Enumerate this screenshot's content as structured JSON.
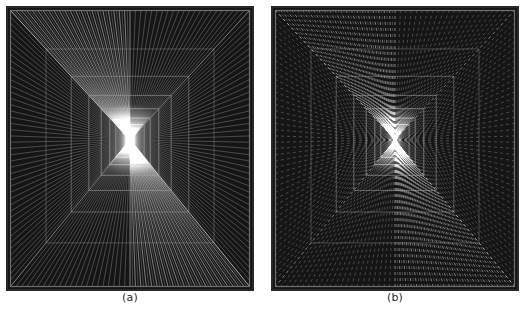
{
  "figure": {
    "title": "",
    "background_color": "#ffffff",
    "width": 527,
    "height": 323,
    "panel_count": 2
  },
  "panels": [
    {
      "id": "panel-a",
      "caption": "(a)",
      "line_style": "solid",
      "background_color": "#151515",
      "frame_color": "#6e6e6e",
      "ray_color": "#9a9a9a",
      "center_glow_color": "#e8e8e8",
      "x": 6,
      "y": 6,
      "width": 248,
      "height": 285,
      "rays": 176,
      "nested_frames": 7,
      "center_x": 0.5,
      "center_y": 0.47
    },
    {
      "id": "panel-b",
      "caption": "(b)",
      "line_style": "dashed",
      "background_color": "#151515",
      "frame_color": "#6e6e6e",
      "ray_color": "#9a9a9a",
      "center_glow_color": "#e8e8e8",
      "x": 271,
      "y": 6,
      "width": 248,
      "height": 285,
      "rays": 176,
      "nested_frames": 7,
      "center_x": 0.5,
      "center_y": 0.47,
      "dash_on": 3,
      "dash_off": 3
    }
  ],
  "captions": {
    "a": "(a)",
    "b": "(b)"
  },
  "colors": {
    "page_background": "#ffffff",
    "panel_background": "#151515",
    "line": "#9a9a9a",
    "frame": "#6e6e6e",
    "caption_text": "#2b2b2b"
  }
}
